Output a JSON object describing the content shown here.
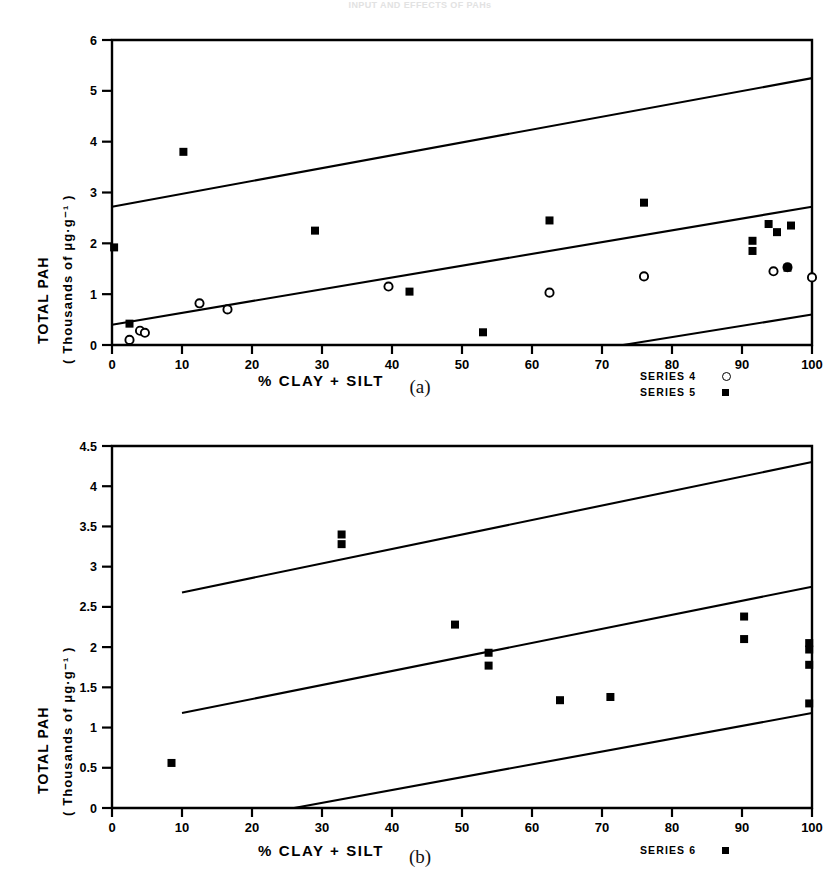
{
  "faint_header": "INPUT AND EFFECTS OF PAHs",
  "panels": [
    {
      "id": "a",
      "panel_label": "(a)",
      "ylabel_line1": "TOTAL   PAH",
      "ylabel_line2": "( Thousands  of   μg·g⁻¹ )",
      "xlabel": "%   CLAY  +  SILT",
      "legend": [
        {
          "label": "SERIES 4",
          "marker": "open-circle"
        },
        {
          "label": "SERIES 5",
          "marker": "filled-square"
        }
      ]
    },
    {
      "id": "b",
      "panel_label": "(b)",
      "ylabel_line1": "TOTAL   PAH",
      "ylabel_line2": "( Thousands  of   μg·g⁻¹ )",
      "xlabel": "%   CLAY  +  SILT",
      "legend": [
        {
          "label": "SERIES 6",
          "marker": "filled-square"
        }
      ]
    }
  ],
  "chart_data": [
    {
      "type": "scatter",
      "id": "a",
      "title": "",
      "xlabel": "% CLAY + SILT",
      "ylabel": "TOTAL PAH (Thousands of μg·g⁻¹)",
      "xlim": [
        0,
        100
      ],
      "ylim": [
        0,
        6
      ],
      "xticks": [
        0,
        10,
        20,
        30,
        40,
        50,
        60,
        70,
        80,
        90,
        100
      ],
      "xtick_labels": [
        "0",
        "10",
        "20",
        "30",
        "40",
        "50",
        "60",
        "70",
        "80",
        "90",
        "100"
      ],
      "yticks": [
        0,
        1,
        2,
        3,
        4,
        5,
        6
      ],
      "ytick_labels": [
        "0",
        "1",
        "2",
        "3",
        "4",
        "5",
        "6"
      ],
      "grid": false,
      "legend_position": "bottom-right",
      "series": [
        {
          "name": "SERIES 4",
          "marker": "open-circle",
          "points": [
            [
              2.5,
              0.1
            ],
            [
              4.0,
              0.28
            ],
            [
              4.7,
              0.24
            ],
            [
              12.5,
              0.82
            ],
            [
              16.5,
              0.7
            ],
            [
              39.5,
              1.15
            ],
            [
              62.5,
              1.03
            ],
            [
              76.0,
              1.35
            ],
            [
              94.5,
              1.45
            ],
            [
              96.5,
              1.53
            ],
            [
              100.0,
              1.33
            ]
          ]
        },
        {
          "name": "SERIES 5",
          "marker": "filled-square",
          "points": [
            [
              0.3,
              1.92
            ],
            [
              2.5,
              0.42
            ],
            [
              10.2,
              3.8
            ],
            [
              29.0,
              2.25
            ],
            [
              42.5,
              1.05
            ],
            [
              53.0,
              0.25
            ],
            [
              62.5,
              2.45
            ],
            [
              76.0,
              2.8
            ],
            [
              91.5,
              1.85
            ],
            [
              91.5,
              2.05
            ],
            [
              93.8,
              2.38
            ],
            [
              95.0,
              2.22
            ],
            [
              97.0,
              2.35
            ],
            [
              96.5,
              1.52
            ]
          ]
        }
      ],
      "lines": [
        {
          "name": "upper-bound",
          "x": [
            0,
            100
          ],
          "y": [
            2.72,
            5.25
          ]
        },
        {
          "name": "regression",
          "x": [
            0,
            100
          ],
          "y": [
            0.4,
            2.72
          ]
        },
        {
          "name": "lower-bound",
          "x": [
            73,
            100
          ],
          "y": [
            0.0,
            0.6
          ]
        }
      ]
    },
    {
      "type": "scatter",
      "id": "b",
      "title": "",
      "xlabel": "% CLAY + SILT",
      "ylabel": "TOTAL PAH (Thousands of μg·g⁻¹)",
      "xlim": [
        0,
        100
      ],
      "ylim": [
        0,
        4.5
      ],
      "xticks": [
        0,
        10,
        20,
        30,
        40,
        50,
        60,
        70,
        80,
        90,
        100
      ],
      "xtick_labels": [
        "0",
        "10",
        "20",
        "30",
        "40",
        "50",
        "60",
        "70",
        "80",
        "90",
        "100"
      ],
      "yticks": [
        0,
        0.5,
        1,
        1.5,
        2,
        2.5,
        3,
        3.5,
        4,
        4.5
      ],
      "ytick_labels": [
        "0",
        "0.5",
        "1",
        "1.5",
        "2",
        "2.5",
        "3",
        "3.5",
        "4",
        "4.5"
      ],
      "grid": false,
      "legend_position": "bottom-right",
      "series": [
        {
          "name": "SERIES 6",
          "marker": "filled-square",
          "points": [
            [
              8.5,
              0.56
            ],
            [
              32.8,
              3.4
            ],
            [
              32.8,
              3.28
            ],
            [
              49.0,
              2.28
            ],
            [
              53.8,
              1.93
            ],
            [
              53.8,
              1.77
            ],
            [
              64.0,
              1.34
            ],
            [
              71.2,
              1.38
            ],
            [
              90.3,
              2.38
            ],
            [
              90.3,
              2.1
            ],
            [
              99.6,
              2.05
            ],
            [
              99.6,
              1.97
            ],
            [
              99.6,
              1.78
            ],
            [
              99.6,
              1.3
            ]
          ]
        }
      ],
      "lines": [
        {
          "name": "upper-bound",
          "x": [
            10,
            100
          ],
          "y": [
            2.68,
            4.3
          ]
        },
        {
          "name": "regression",
          "x": [
            10,
            100
          ],
          "y": [
            1.18,
            2.75
          ]
        },
        {
          "name": "lower-bound",
          "x": [
            26,
            100
          ],
          "y": [
            0.0,
            1.18
          ]
        }
      ]
    }
  ]
}
